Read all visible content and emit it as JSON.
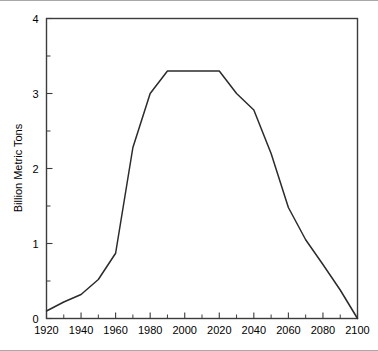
{
  "chart_data": {
    "type": "line",
    "title": "",
    "subtitle": "",
    "xlabel": "",
    "ylabel": "Billion Metric Tons",
    "xlim": [
      1920,
      2100
    ],
    "ylim": [
      0,
      4
    ],
    "grid": false,
    "legend": null,
    "legend_position": "none",
    "x_ticks": [
      1920,
      1940,
      1960,
      1980,
      2000,
      2020,
      2040,
      2060,
      2080,
      2100
    ],
    "x_tick_labels": [
      "1920",
      "1940",
      "1960",
      "1980",
      "2000",
      "2020",
      "2040",
      "2060",
      "2080",
      "2100"
    ],
    "x_minor_ticks": [
      1930,
      1950,
      1970,
      1990,
      2010,
      2030,
      2050,
      2070,
      2090
    ],
    "y_ticks": [
      0,
      1,
      2,
      3,
      4
    ],
    "y_tick_labels": [
      "0",
      "1",
      "2",
      "3",
      "4"
    ],
    "y_minor_ticks": [
      0.5,
      1.5,
      2.5,
      3.5
    ],
    "x": [
      1920,
      1930,
      1940,
      1950,
      1960,
      1970,
      1980,
      1990,
      2000,
      2010,
      2020,
      2030,
      2040,
      2050,
      2060,
      2070,
      2080,
      2090,
      2100
    ],
    "series": [
      {
        "name": "Carbon emissions",
        "values": [
          0.1,
          0.22,
          0.32,
          0.52,
          0.87,
          2.28,
          3.0,
          3.3,
          3.3,
          3.3,
          3.3,
          3.0,
          2.78,
          2.2,
          1.48,
          1.05,
          0.72,
          0.38,
          0.0
        ]
      }
    ],
    "annotations": []
  },
  "axes": {
    "y_axis_title": "Billion Metric Tons"
  }
}
